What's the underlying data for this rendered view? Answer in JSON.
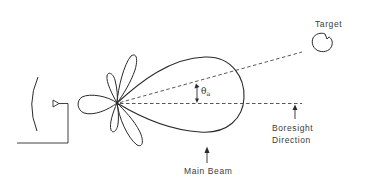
{
  "diagram": {
    "type": "radar antenna beam pattern",
    "labels": {
      "target": "Target",
      "boresight_line1": "Boresight",
      "boresight_line2": "Direction",
      "main_beam": "Main Beam",
      "angle_symbol": "θ",
      "angle_subscript": "a"
    },
    "elements": [
      "reflector-dish",
      "feed-horn",
      "feed-line",
      "side-lobes",
      "back-lobe",
      "main-lobe",
      "boresight-axis",
      "target-line",
      "target-object",
      "angle-arrow"
    ],
    "colors": {
      "stroke": "#2a2a2a",
      "dash": "#444444",
      "background": "#ffffff"
    }
  }
}
